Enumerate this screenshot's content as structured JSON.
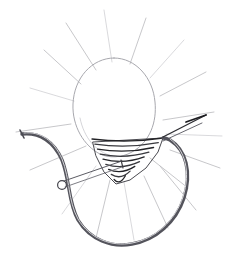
{
  "image": {
    "title": "Line drawing of egg-shaped form with looped cord",
    "medium": "pen-and-ink line drawing",
    "style": "monochrome contour and hatch sketch",
    "background_color": "#ffffff",
    "width": 232,
    "height": 268,
    "caption": "",
    "text_content": "none"
  },
  "palette": {
    "ray_stroke": "#b9b9bd",
    "ray_stroke_faint": "#cfcfd3",
    "outline_stroke": "#a8a8ae",
    "outline_stroke_dark": "#8e8e96",
    "hatch_stroke": "#3a3a3f",
    "hatch_stroke_dark": "#232327",
    "cord_stroke": "#6a6a72",
    "cord_stroke_dark": "#4a4a52",
    "cord_highlight": "#d2d2d6",
    "rod_stroke": "#5c5c64",
    "ring_stroke": "#55555d",
    "needle_stroke": "#2e2e33"
  },
  "elements": {
    "egg": {
      "name": "egg-shaped body",
      "center_x": 114,
      "center_y": 110,
      "radius_x": 41,
      "radius_y": 52,
      "stroke_width": 1.0,
      "fill": "none"
    },
    "hatched_cone": {
      "name": "hatched conical base",
      "apex_y": 183,
      "top_left_x": 92,
      "top_right_x": 163,
      "top_y": 139,
      "hatch_line_count": 9,
      "stroke_width": 1.3
    },
    "cord_loop": {
      "name": "thick looped cord",
      "stroke_width": 3.2,
      "left_end_x": 22,
      "left_end_y": 134,
      "right_end_x": 163,
      "right_end_y": 139,
      "lowest_y": 245
    },
    "rod": {
      "name": "thin straight rod",
      "x1": 62,
      "y1": 184,
      "x2": 122,
      "y2": 164,
      "stroke_width": 1.1
    },
    "ring": {
      "name": "small ring clasp",
      "cx": 63,
      "cy": 184,
      "r": 4.2,
      "stroke_width": 1.2
    },
    "needle": {
      "name": "pointed needle tip",
      "x1": 163,
      "y1": 139,
      "x2": 205,
      "y2": 117,
      "stroke_width": 1.6
    },
    "rays": {
      "name": "radiating ray lines",
      "count": 18,
      "stroke_width": 0.8,
      "origin_x": 114,
      "origin_y": 150,
      "description": "faint straight lines radiating outward from the central hatched region"
    }
  },
  "ray_lines": [
    {
      "x1": 112,
      "y1": 62,
      "x2": 104,
      "y2": 10
    },
    {
      "x1": 96,
      "y1": 70,
      "x2": 66,
      "y2": 23
    },
    {
      "x1": 130,
      "y1": 64,
      "x2": 146,
      "y2": 18
    },
    {
      "x1": 150,
      "y1": 78,
      "x2": 184,
      "y2": 40
    },
    {
      "x1": 81,
      "y1": 84,
      "x2": 44,
      "y2": 50
    },
    {
      "x1": 160,
      "y1": 96,
      "x2": 206,
      "y2": 72
    },
    {
      "x1": 74,
      "y1": 101,
      "x2": 30,
      "y2": 88
    },
    {
      "x1": 163,
      "y1": 120,
      "x2": 214,
      "y2": 112
    },
    {
      "x1": 71,
      "y1": 124,
      "x2": 16,
      "y2": 132
    },
    {
      "x1": 166,
      "y1": 134,
      "x2": 222,
      "y2": 136
    },
    {
      "x1": 86,
      "y1": 146,
      "x2": 30,
      "y2": 170
    },
    {
      "x1": 170,
      "y1": 150,
      "x2": 220,
      "y2": 168
    },
    {
      "x1": 96,
      "y1": 166,
      "x2": 62,
      "y2": 214
    },
    {
      "x1": 160,
      "y1": 166,
      "x2": 196,
      "y2": 210
    },
    {
      "x1": 110,
      "y1": 180,
      "x2": 96,
      "y2": 238
    },
    {
      "x1": 124,
      "y1": 182,
      "x2": 134,
      "y2": 240
    },
    {
      "x1": 144,
      "y1": 176,
      "x2": 168,
      "y2": 228
    },
    {
      "x1": 150,
      "y1": 158,
      "x2": 188,
      "y2": 188
    }
  ]
}
